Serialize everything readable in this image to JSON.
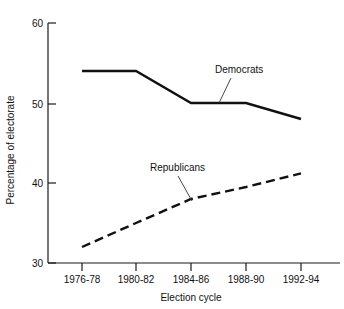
{
  "chart_data": {
    "type": "line",
    "title": "",
    "xlabel": "Election cycle",
    "ylabel": "Percentage of electorate",
    "categories": [
      "1976-78",
      "1980-82",
      "1984-86",
      "1988-90",
      "1992-94"
    ],
    "ylim": [
      30,
      60
    ],
    "yticks": [
      30,
      40,
      50,
      60
    ],
    "ytick_labels": [
      "30",
      "40",
      "50",
      "60"
    ],
    "grid": false,
    "legend_position": "inline-annotation",
    "series": [
      {
        "name": "Democrats",
        "style": "solid",
        "color": "#111111",
        "values": [
          54.0,
          54.0,
          50.0,
          50.0,
          48.0
        ]
      },
      {
        "name": "Republicans",
        "style": "dashed",
        "color": "#111111",
        "values": [
          32.0,
          35.0,
          38.0,
          39.5,
          41.2
        ]
      }
    ],
    "annotations": [
      {
        "text": "Democrats",
        "series": "Democrats",
        "at_category": "1988-90"
      },
      {
        "text": "Republicans",
        "series": "Republicans",
        "at_category": "1984-86"
      }
    ]
  }
}
